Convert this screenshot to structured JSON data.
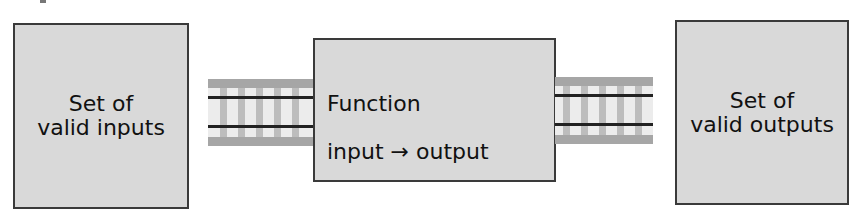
{
  "diagram": {
    "input_box": {
      "label": "Set of\nvalid inputs"
    },
    "function_box": {
      "title": "Function",
      "mapping": "input → output"
    },
    "output_box": {
      "label": "Set of\nvalid outputs"
    },
    "connectors": [
      {
        "from": "input_box",
        "to": "function_box",
        "style": "railroad-track"
      },
      {
        "from": "function_box",
        "to": "output_box",
        "style": "railroad-track"
      }
    ],
    "colors": {
      "box_fill": "#d9d9d9",
      "box_border": "#3a3a3a",
      "track_band": "#a6a6a6",
      "track_rail": "#222222",
      "track_tie": "#bdbdbd"
    }
  }
}
